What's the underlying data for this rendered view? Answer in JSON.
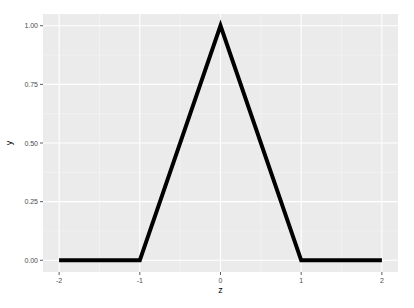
{
  "chart_data": {
    "type": "line",
    "title": "",
    "xlabel": "z",
    "ylabel": "y",
    "x": [
      -2,
      -1,
      0,
      1,
      2
    ],
    "series": [
      {
        "name": "y",
        "x": [
          -2,
          -1,
          0,
          1,
          2
        ],
        "values": [
          0,
          0,
          1,
          0,
          0
        ]
      }
    ],
    "xlim": [
      -2.2,
      2.2
    ],
    "ylim": [
      -0.05,
      1.05
    ],
    "x_ticks": [
      -2,
      -1,
      0,
      1,
      2
    ],
    "x_tick_labels": [
      "-2",
      "-1",
      "0",
      "1",
      "2"
    ],
    "y_ticks": [
      0,
      0.25,
      0.5,
      0.75,
      1.0
    ],
    "y_tick_labels": [
      "0.00",
      "0.25",
      "0.50",
      "0.75",
      "1.00"
    ],
    "grid": true,
    "legend": "none",
    "colors": {
      "panel": "#ebebeb",
      "grid_major": "#ffffff",
      "grid_minor": "#f5f5f5",
      "line": "#000000"
    }
  }
}
